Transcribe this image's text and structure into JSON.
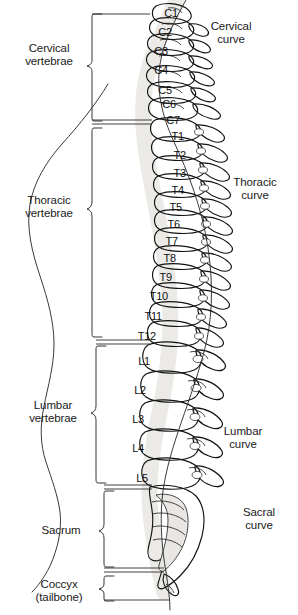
{
  "figure": {
    "width": 298,
    "height": 615,
    "background": "#ffffff"
  },
  "regions": [
    {
      "id": "cervical",
      "label": "Cervical\nvertebrae",
      "x": 12,
      "y": 44,
      "w": 80,
      "bracket_top": 18,
      "bracket_bottom": 120,
      "bracket_x": 92
    },
    {
      "id": "thoracic",
      "label": "Thoracic\nvertebrae",
      "x": 12,
      "y": 195,
      "w": 80,
      "bracket_top": 127,
      "bracket_bottom": 336,
      "bracket_x": 92
    },
    {
      "id": "lumbar",
      "label": "Lumbar\nvertebrae",
      "x": 16,
      "y": 400,
      "w": 80,
      "bracket_top": 344,
      "bracket_bottom": 482,
      "bracket_x": 96
    },
    {
      "id": "sacrum",
      "label": "Sacrum",
      "x": 16,
      "y": 527,
      "w": 80,
      "bracket_top": 489,
      "bracket_bottom": 568,
      "bracket_x": 104
    },
    {
      "id": "coccyx",
      "label": "Coccyx\n(tailbone)",
      "x": 16,
      "y": 582,
      "w": 80,
      "bracket_top": 575,
      "bracket_bottom": 600,
      "bracket_x": 104
    }
  ],
  "curves": [
    {
      "id": "cervical-curve",
      "label": "Cervical\ncurve",
      "x": 196,
      "y": 22
    },
    {
      "id": "thoracic-curve",
      "label": "Thoracic\ncurve",
      "x": 222,
      "y": 178
    },
    {
      "id": "lumbar-curve",
      "label": "Lumbar\ncurve",
      "x": 210,
      "y": 427
    },
    {
      "id": "sacral-curve",
      "label": "Sacral\ncurve",
      "x": 228,
      "y": 508
    }
  ],
  "vertebrae": [
    {
      "id": "C1",
      "label": "C1",
      "right": 178,
      "y": 8,
      "leader": true
    },
    {
      "id": "C2",
      "label": "C2",
      "right": 172,
      "y": 27,
      "leader": false
    },
    {
      "id": "C3",
      "label": "C3",
      "right": 168,
      "y": 46,
      "leader": false
    },
    {
      "id": "C4",
      "label": "C4",
      "right": 168,
      "y": 65,
      "leader": false
    },
    {
      "id": "C5",
      "label": "C5",
      "right": 172,
      "y": 85,
      "leader": false
    },
    {
      "id": "C6",
      "label": "C6",
      "right": 176,
      "y": 99,
      "leader": false
    },
    {
      "id": "C7",
      "label": "C7",
      "right": 180,
      "y": 115,
      "leader": true
    },
    {
      "id": "T1",
      "label": "T1",
      "right": 184,
      "y": 131,
      "leader": false
    },
    {
      "id": "T2",
      "label": "T2",
      "right": 186,
      "y": 150,
      "leader": false
    },
    {
      "id": "T3",
      "label": "T3",
      "right": 186,
      "y": 168,
      "leader": false
    },
    {
      "id": "T4",
      "label": "T4",
      "right": 184,
      "y": 185,
      "leader": false
    },
    {
      "id": "T5",
      "label": "T5",
      "right": 182,
      "y": 202,
      "leader": false
    },
    {
      "id": "T6",
      "label": "T6",
      "right": 180,
      "y": 219,
      "leader": false
    },
    {
      "id": "T7",
      "label": "T7",
      "right": 178,
      "y": 236,
      "leader": false
    },
    {
      "id": "T8",
      "label": "T8",
      "right": 176,
      "y": 253,
      "leader": false
    },
    {
      "id": "T9",
      "label": "T9",
      "right": 172,
      "y": 272,
      "leader": false
    },
    {
      "id": "T10",
      "label": "T10",
      "right": 168,
      "y": 291,
      "leader": false
    },
    {
      "id": "T11",
      "label": "T11",
      "right": 162,
      "y": 311,
      "leader": false
    },
    {
      "id": "T12",
      "label": "T12",
      "right": 156,
      "y": 331,
      "leader": false
    },
    {
      "id": "L1",
      "label": "L1",
      "right": 150,
      "y": 356,
      "leader": false
    },
    {
      "id": "L2",
      "label": "L2",
      "right": 146,
      "y": 385,
      "leader": false
    },
    {
      "id": "L3",
      "label": "L3",
      "right": 144,
      "y": 414,
      "leader": false
    },
    {
      "id": "L4",
      "label": "L4",
      "right": 144,
      "y": 443,
      "leader": false
    },
    {
      "id": "L5",
      "label": "L5",
      "right": 148,
      "y": 473,
      "leader": false
    }
  ]
}
